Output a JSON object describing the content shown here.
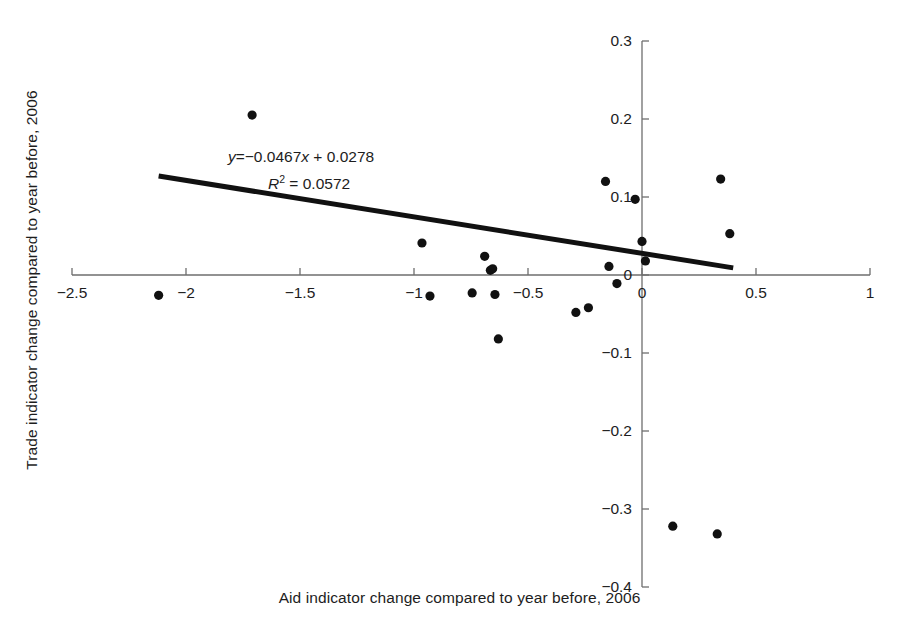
{
  "chart_data": {
    "type": "scatter",
    "title": "",
    "xlabel": "Aid indicator change compared to year before, 2006",
    "ylabel": "Trade indicator change compared to year before, 2006",
    "xlim": [
      -2.75,
      1.0
    ],
    "ylim": [
      -0.4,
      0.3
    ],
    "xticks": [
      -2.5,
      -2,
      -1.5,
      -1,
      -0.5,
      0,
      0.5,
      1
    ],
    "xtick_labels": [
      "−2.5",
      "−2",
      "−1.5",
      "−1",
      "−0.5",
      "0",
      "0.5",
      "1"
    ],
    "yticks": [
      -0.4,
      -0.3,
      -0.2,
      -0.1,
      0,
      0.1,
      0.2,
      0.3
    ],
    "ytick_labels": [
      "−0.4",
      "−0.3",
      "−0.2",
      "−0.1",
      "0",
      "0.1",
      "0.2",
      "0.3"
    ],
    "grid": false,
    "legend": null,
    "marker_color": "#111111",
    "marker_size": 6,
    "points": [
      {
        "x": -2.12,
        "y": -0.026
      },
      {
        "x": -1.71,
        "y": 0.205
      },
      {
        "x": -0.965,
        "y": 0.041
      },
      {
        "x": -0.93,
        "y": -0.027
      },
      {
        "x": -0.745,
        "y": -0.023
      },
      {
        "x": -0.69,
        "y": 0.024
      },
      {
        "x": -0.665,
        "y": 0.006
      },
      {
        "x": -0.655,
        "y": 0.008
      },
      {
        "x": -0.645,
        "y": -0.025
      },
      {
        "x": -0.63,
        "y": -0.082
      },
      {
        "x": -0.29,
        "y": -0.048
      },
      {
        "x": -0.235,
        "y": -0.042
      },
      {
        "x": -0.16,
        "y": 0.12
      },
      {
        "x": -0.145,
        "y": 0.011
      },
      {
        "x": -0.11,
        "y": -0.011
      },
      {
        "x": -0.03,
        "y": 0.097
      },
      {
        "x": 0.0,
        "y": 0.043
      },
      {
        "x": 0.015,
        "y": 0.018
      },
      {
        "x": 0.135,
        "y": -0.322
      },
      {
        "x": 0.345,
        "y": 0.123
      },
      {
        "x": 0.33,
        "y": -0.332
      },
      {
        "x": 0.385,
        "y": 0.053
      }
    ],
    "trendline": {
      "slope": -0.0467,
      "intercept": 0.0278,
      "x_start": -2.12,
      "x_end": 0.4,
      "color": "#111111",
      "width": 5
    },
    "annotations": {
      "equation_y": "y",
      "equation_eq": "=",
      "equation_rhs": "−0.0467",
      "equation_x": "x",
      "equation_plus": "+",
      "equation_intercept": "0.0278",
      "r_symbol": "R",
      "r_exponent": "2",
      "r_eq": "=",
      "r_value": "0.0572"
    }
  },
  "axis_style": {
    "axis_color": "#6e6e6e",
    "axis_width": 1.3,
    "tick_length": 7
  }
}
